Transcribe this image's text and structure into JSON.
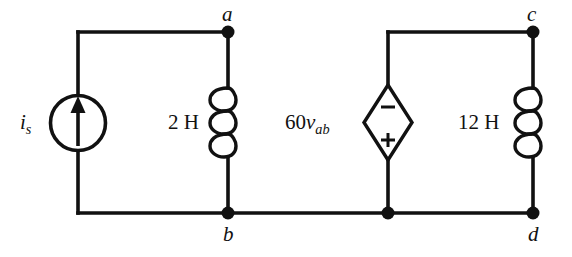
{
  "figure": {
    "kind": "circuit-schematic",
    "background_color": "#ffffff",
    "line_color": "#111111",
    "width": 572,
    "height": 257
  },
  "nodes": {
    "a": "a",
    "b": "b",
    "c": "c",
    "d": "d"
  },
  "components": {
    "current_source": {
      "symbol": "independent-current-source",
      "label_text": "i",
      "label_sub": "s",
      "arrow_direction": "up"
    },
    "inductor_left": {
      "symbol": "inductor",
      "value": "2 H"
    },
    "dependent_source": {
      "symbol": "dependent-voltage-source-diamond",
      "label_prefix": "60",
      "label_var": "v",
      "label_sub": "ab",
      "terminal_top": "−",
      "terminal_bottom": "+"
    },
    "inductor_right": {
      "symbol": "inductor",
      "value": "12 H"
    }
  }
}
